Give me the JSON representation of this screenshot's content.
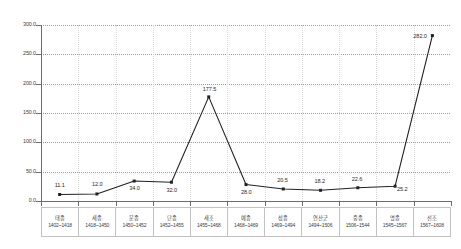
{
  "chart_data": {
    "type": "line",
    "title": "",
    "xlabel": "",
    "ylabel": "",
    "ylim": [
      0,
      300
    ],
    "ytick_labels": [
      "300.0",
      "250.0",
      "200.0",
      "150.0",
      "100.0",
      "50.0",
      "0.0"
    ],
    "ytick_values": [
      300,
      250,
      200,
      150,
      100,
      50,
      0
    ],
    "grid": "horizontal-dotted",
    "legend": "none",
    "marker": "filled-square",
    "line_color": "#222222",
    "categories": [
      "태종",
      "세종",
      "문종",
      "단종",
      "세조",
      "예종",
      "성종",
      "연산군",
      "중종",
      "명종",
      "선조"
    ],
    "category_ranges": [
      "1402~1418",
      "1418~1450",
      "1450~1452",
      "1452~1455",
      "1455~1468",
      "1468~1469",
      "1469~1494",
      "1494~1506",
      "1506~1544",
      "1545~1567",
      "1567~1608"
    ],
    "values": [
      11.1,
      12.0,
      34.0,
      32.0,
      177.5,
      28.0,
      20.5,
      18.2,
      22.6,
      25.2,
      282.0
    ],
    "value_labels": [
      "11.1",
      "12.0",
      "34.0",
      "32.0",
      "177.5",
      "28.0",
      "20.5",
      "18.2",
      "22.6",
      "25.2",
      "282.0"
    ],
    "label_offsets": [
      {
        "dx": -5,
        "dy": -11
      },
      {
        "dx": -5,
        "dy": -12
      },
      {
        "dx": -5,
        "dy": 5
      },
      {
        "dx": -5,
        "dy": 6
      },
      {
        "dx": -6,
        "dy": -10
      },
      {
        "dx": -5,
        "dy": 5
      },
      {
        "dx": -6,
        "dy": -11
      },
      {
        "dx": -6,
        "dy": -11
      },
      {
        "dx": -6,
        "dy": -11
      },
      {
        "dx": 2,
        "dy": 1
      },
      {
        "dx": -19,
        "dy": -2
      }
    ]
  }
}
